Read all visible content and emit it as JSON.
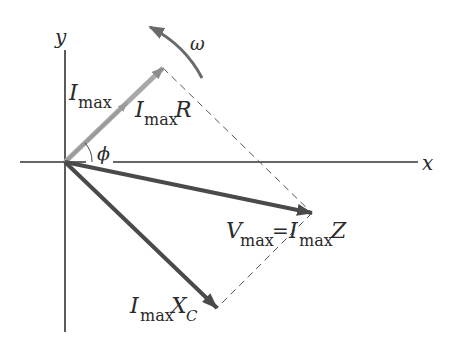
{
  "diagram": {
    "type": "phasor-diagram",
    "axes": {
      "x_label": "x",
      "y_label": "y"
    },
    "angular_velocity_label": "ω",
    "angle_label": "ϕ",
    "phasors": [
      {
        "name": "I_max",
        "label_main": "I",
        "label_sub": "max",
        "color": "#9a9a9a"
      },
      {
        "name": "I_max R",
        "label_main": "I",
        "label_sub": "max",
        "label_tail": "R",
        "color": "#8c8c8c"
      },
      {
        "name": "V_max = I_max Z",
        "label_main": "V",
        "label_sub": "max",
        "label_eq": " = ",
        "label_main2": "I",
        "label_sub2": "max",
        "label_tail": "Z",
        "color": "#4a4a4a"
      },
      {
        "name": "I_max X_C",
        "label_main": "I",
        "label_sub": "max",
        "label_tail": "X",
        "label_tail_sub": "C",
        "color": "#4a4a4a"
      }
    ],
    "colors": {
      "axis": "#333333",
      "dashed": "#555555",
      "omega_arrow": "#6a6a6a"
    }
  }
}
